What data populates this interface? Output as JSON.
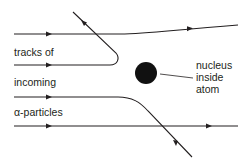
{
  "diagram": {
    "type": "rutherford-scattering",
    "labels": {
      "tracks_line1": "tracks of",
      "tracks_line2": "incoming",
      "tracks_line3": "α-particles",
      "nucleus_line1": "nucleus",
      "nucleus_line2": "inside",
      "nucleus_line3": "atom"
    },
    "colors": {
      "ink": "#231f20",
      "background": "#ffffff"
    },
    "tracks": [
      {
        "name": "top-track",
        "behavior": "slight upward deflection"
      },
      {
        "name": "reflected-track",
        "behavior": "bounced back"
      },
      {
        "name": "scattered-track",
        "behavior": "large downward deflection"
      },
      {
        "name": "bottom-track",
        "behavior": "undeflected"
      }
    ],
    "nucleus": {
      "shape": "filled circle"
    }
  }
}
